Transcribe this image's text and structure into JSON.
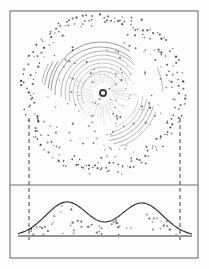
{
  "figure": {
    "title": "",
    "background_color": "#fdfdfc",
    "ink_color": "#4a4a4a",
    "dot_color": "#3d3d3d",
    "curve_color": "#2e2e2e",
    "frame": {
      "name": "outer-frame",
      "x": 10,
      "y": 11,
      "width": 188,
      "height": 247,
      "stroke": "#7b7b7b",
      "stroke_width": 1.2
    },
    "divider": {
      "name": "panel-divider",
      "y": 185,
      "x1": 10,
      "x2": 198,
      "stroke": "#6e6e6e",
      "stroke_width": 1.1
    },
    "projection_lines": [
      {
        "label": "left-projection",
        "x": 29,
        "y1": 118,
        "y2": 240
      },
      {
        "label": "right-projection",
        "x": 180,
        "y1": 118,
        "y2": 240
      }
    ],
    "projection_style": {
      "dash": "4,3",
      "stroke": "#555555",
      "stroke_width": 1.1
    }
  },
  "chart_data": {
    "type": "scatter",
    "title": "",
    "subtitle": "",
    "xlabel": "",
    "ylabel": "",
    "grid": false,
    "legend": false,
    "panels": [
      {
        "id": "upper-panel",
        "name": "spatial-distribution-panel",
        "type": "scatter",
        "description": "dotted annular halo with inner spiral arc segments around a central marker",
        "xlim": [
          10,
          198
        ],
        "ylim": [
          11,
          185
        ],
        "center": {
          "x": 103,
          "y": 93
        },
        "center_marker": {
          "name": "central-object-marker",
          "shape": "open-circle",
          "radius_outer": 4.0,
          "radius_inner": 2.1,
          "stroke": "#3a3a3a"
        },
        "halo": {
          "name": "outer-dotted-ring",
          "mean_radius": 76,
          "radius_spread": 7,
          "point_count": 220,
          "point_radius": 0.85
        },
        "scatter_field": {
          "name": "interior-scatter",
          "max_radius": 70,
          "point_count": 120,
          "point_radius": 0.8
        },
        "spiral_arcs": [
          {
            "cx": 103,
            "cy": 93,
            "r": 22,
            "a0": 150,
            "a1": 330,
            "w": 0.55,
            "op": 0.5
          },
          {
            "cx": 103,
            "cy": 93,
            "r": 26,
            "a0": 140,
            "a1": 340,
            "w": 0.55,
            "op": 0.55
          },
          {
            "cx": 103,
            "cy": 93,
            "r": 30,
            "a0": 155,
            "a1": 335,
            "w": 0.55,
            "op": 0.5
          },
          {
            "cx": 103,
            "cy": 93,
            "r": 34,
            "a0": 165,
            "a1": 325,
            "w": 0.6,
            "op": 0.6
          },
          {
            "cx": 103,
            "cy": 93,
            "r": 38,
            "a0": 170,
            "a1": 320,
            "w": 0.6,
            "op": 0.58
          },
          {
            "cx": 103,
            "cy": 93,
            "r": 42,
            "a0": 175,
            "a1": 318,
            "w": 0.65,
            "op": 0.65
          },
          {
            "cx": 101,
            "cy": 93,
            "r": 46,
            "a0": 178,
            "a1": 312,
            "w": 0.7,
            "op": 0.7
          },
          {
            "cx": 101,
            "cy": 92,
            "r": 50,
            "a0": 182,
            "a1": 305,
            "w": 0.75,
            "op": 0.72
          },
          {
            "cx": 100,
            "cy": 92,
            "r": 18,
            "a0": 200,
            "a1": 340,
            "w": 0.5,
            "op": 0.4
          },
          {
            "cx": 103,
            "cy": 93,
            "r": 36,
            "a0": 10,
            "a1": 70,
            "w": 0.6,
            "op": 0.45
          },
          {
            "cx": 103,
            "cy": 93,
            "r": 40,
            "a0": 5,
            "a1": 75,
            "w": 0.6,
            "op": 0.5
          },
          {
            "cx": 103,
            "cy": 93,
            "r": 44,
            "a0": 8,
            "a1": 80,
            "w": 0.65,
            "op": 0.58
          },
          {
            "cx": 103,
            "cy": 93,
            "r": 48,
            "a0": 12,
            "a1": 82,
            "w": 0.7,
            "op": 0.62
          },
          {
            "cx": 103,
            "cy": 93,
            "r": 52,
            "a0": 15,
            "a1": 78,
            "w": 0.7,
            "op": 0.6
          },
          {
            "cx": 103,
            "cy": 93,
            "r": 56,
            "a0": 20,
            "a1": 72,
            "w": 0.65,
            "op": 0.52
          },
          {
            "cx": 103,
            "cy": 93,
            "r": 55,
            "a0": 185,
            "a1": 215,
            "w": 0.8,
            "op": 0.72
          },
          {
            "cx": 103,
            "cy": 93,
            "r": 59,
            "a0": 188,
            "a1": 212,
            "w": 0.8,
            "op": 0.68
          },
          {
            "cx": 103,
            "cy": 93,
            "r": 62,
            "a0": 190,
            "a1": 208,
            "w": 0.7,
            "op": 0.55
          },
          {
            "cx": 103,
            "cy": 93,
            "r": 60,
            "a0": 335,
            "a1": 358,
            "w": 0.7,
            "op": 0.55
          }
        ],
        "radial_spoke_count": 46,
        "radial_spoke_inner": 8,
        "radial_spoke_outer": 30
      },
      {
        "id": "lower-panel",
        "name": "profile-panel",
        "type": "line",
        "description": "double-peaked projected profile with scattered points under the curve",
        "baseline_y": 236,
        "baseline_x1": 18,
        "baseline_x2": 192,
        "xlim": [
          29,
          180
        ],
        "ylim": [
          0,
          1
        ],
        "peaks": [
          {
            "center_x": 67,
            "height": 34,
            "width": 30
          },
          {
            "center_x": 142,
            "height": 33,
            "width": 30
          }
        ],
        "curve_samples": 260,
        "under_curve_points": 60
      }
    ]
  },
  "annotations": []
}
